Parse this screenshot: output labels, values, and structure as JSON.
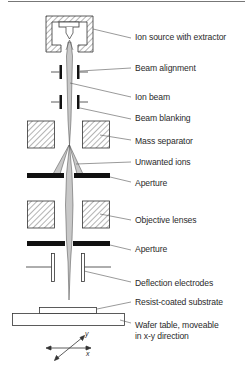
{
  "diagram": {
    "title": "",
    "labels": {
      "ion_source": "Ion source with extractor",
      "beam_alignment": "Beam alignment",
      "ion_beam": "Ion beam",
      "beam_blanking": "Beam blanking",
      "mass_separator": "Mass separator",
      "unwanted_ions": "Unwanted ions",
      "aperture_1": "Aperture",
      "objective_lenses": "Objective lenses",
      "aperture_2": "Aperture",
      "deflection_electrodes": "Deflection electrodes",
      "substrate": "Resist-coated substrate",
      "wafer_table_line1": "Wafer table, moveable",
      "wafer_table_line2": "in x-y direction"
    },
    "axes": {
      "x": "x",
      "y": "y"
    },
    "colors": {
      "line": "#333333",
      "beam": "#c8c8c8",
      "plate": "#111111",
      "hatch": "#666666"
    }
  }
}
